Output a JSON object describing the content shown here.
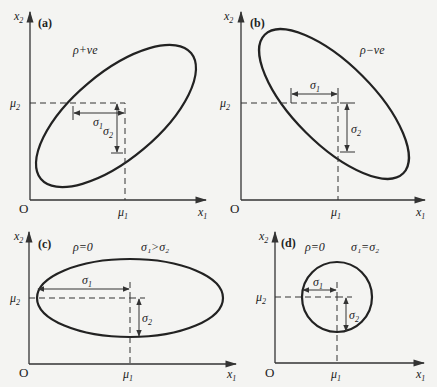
{
  "figure": {
    "panels": [
      {
        "id": "a",
        "label": "(a)",
        "correlation_label": "ρ+ve",
        "sigma_relation": "",
        "axes": {
          "y_label": "x",
          "y_sub": "2",
          "x_label": "x",
          "x_sub": "1",
          "origin": "O"
        },
        "mu1": "μ",
        "mu1_sub": "1",
        "mu2": "μ",
        "mu2_sub": "2",
        "sigma1": "σ",
        "sigma1_sub": "1",
        "sigma2": "σ",
        "sigma2_sub": "2",
        "shape": "ellipse tilted up-right"
      },
      {
        "id": "b",
        "label": "(b)",
        "correlation_label": "ρ−ve",
        "sigma_relation": "",
        "axes": {
          "y_label": "x",
          "y_sub": "2",
          "x_label": "x",
          "x_sub": "1",
          "origin": "O"
        },
        "mu1": "μ",
        "mu1_sub": "1",
        "mu2": "μ",
        "mu2_sub": "2",
        "sigma1": "σ",
        "sigma1_sub": "1",
        "sigma2": "σ",
        "sigma2_sub": "2",
        "shape": "ellipse tilted down-right"
      },
      {
        "id": "c",
        "label": "(c)",
        "correlation_label": "ρ=0",
        "sigma_relation": "σ₁>σ₂",
        "axes": {
          "y_label": "x",
          "y_sub": "2",
          "x_label": "x",
          "x_sub": "1",
          "origin": "O"
        },
        "mu1": "μ",
        "mu1_sub": "1",
        "mu2": "μ",
        "mu2_sub": "2",
        "sigma1": "σ",
        "sigma1_sub": "1",
        "sigma2": "σ",
        "sigma2_sub": "2",
        "shape": "horizontal ellipse"
      },
      {
        "id": "d",
        "label": "(d)",
        "correlation_label": "ρ=0",
        "sigma_relation": "σ₁=σ₂",
        "axes": {
          "y_label": "x",
          "y_sub": "2",
          "x_label": "x",
          "x_sub": "1",
          "origin": "O"
        },
        "mu1": "μ",
        "mu1_sub": "1",
        "mu2": "μ",
        "mu2_sub": "2",
        "sigma1": "σ",
        "sigma1_sub": "1",
        "sigma2": "σ",
        "sigma2_sub": "2",
        "shape": "circle"
      }
    ]
  }
}
